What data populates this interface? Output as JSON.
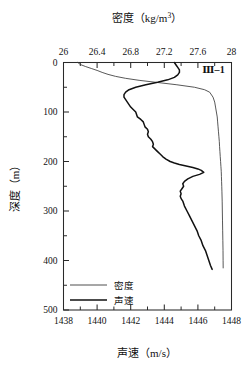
{
  "panel": {
    "label": "Ⅲ–1"
  },
  "axes": {
    "top": {
      "title": "密度（kg/m³）",
      "title_main": "密度",
      "title_unit": "（kg/m",
      "title_sup": "3",
      "title_close": "）",
      "ticks": [
        "26",
        "26.4",
        "26.8",
        "27.2",
        "27.6",
        "28"
      ],
      "tick_values": [
        26,
        26.4,
        26.8,
        27.2,
        27.6,
        28
      ],
      "range": [
        26,
        28
      ]
    },
    "bottom": {
      "title": "声速（m/s）",
      "title_main": "声速",
      "title_unit": "（m/s）",
      "ticks": [
        "1438",
        "1440",
        "1442",
        "1444",
        "1446",
        "1448"
      ],
      "tick_values": [
        1438,
        1440,
        1442,
        1444,
        1446,
        1448
      ],
      "range": [
        1438,
        1448
      ]
    },
    "left": {
      "title": "深度（m）",
      "title_main": "深度",
      "title_unit": "（m）",
      "ticks": [
        "0",
        "100",
        "200",
        "300",
        "400",
        "500"
      ],
      "tick_values": [
        0,
        100,
        200,
        300,
        400,
        500
      ],
      "range": [
        0,
        500
      ]
    }
  },
  "legend": {
    "items": [
      {
        "label": "密度",
        "style": "thin"
      },
      {
        "label": "声速",
        "style": "thick"
      }
    ]
  },
  "colors": {
    "axis": "#2a2a2a",
    "density_line": "#3a3a3a",
    "speed_line": "#111111",
    "background": "#ffffff"
  },
  "chart_data": {
    "type": "line",
    "subtitle": "Ⅲ–1",
    "orientation": "vertical-profile",
    "xlabel_top": "密度（kg/m³）",
    "xlabel_bottom": "声速（m/s）",
    "ylabel": "深度（m）",
    "ylim": [
      0,
      500
    ],
    "y_inverted": true,
    "xlim_top": [
      26,
      28
    ],
    "xlim_bottom": [
      1438,
      1448
    ],
    "grid": false,
    "legend_position": "bottom-left",
    "series": [
      {
        "name": "密度",
        "axis": "top",
        "units": "kg/m³",
        "depth": [
          0,
          4,
          8,
          12,
          16,
          20,
          24,
          28,
          32,
          36,
          40,
          45,
          50,
          55,
          60,
          70,
          80,
          90,
          100,
          110,
          120,
          130,
          140,
          150,
          160,
          170,
          180,
          190,
          200,
          205,
          210,
          215,
          220,
          230,
          240,
          250,
          260,
          280,
          300,
          320,
          340,
          360,
          380,
          400,
          415
        ],
        "values": [
          26.17,
          26.2,
          26.26,
          26.33,
          26.4,
          26.46,
          26.53,
          26.62,
          26.74,
          26.9,
          27.1,
          27.35,
          27.56,
          27.68,
          27.74,
          27.78,
          27.8,
          27.81,
          27.82,
          27.83,
          27.835,
          27.84,
          27.845,
          27.85,
          27.855,
          27.858,
          27.862,
          27.866,
          27.87,
          27.872,
          27.874,
          27.876,
          27.878,
          27.88,
          27.882,
          27.884,
          27.886,
          27.889,
          27.891,
          27.893,
          27.895,
          27.897,
          27.899,
          27.9,
          27.901
        ]
      },
      {
        "name": "声速",
        "axis": "bottom",
        "units": "m/s",
        "depth": [
          0,
          5,
          10,
          15,
          20,
          25,
          30,
          35,
          40,
          45,
          50,
          55,
          60,
          65,
          70,
          75,
          80,
          85,
          90,
          95,
          100,
          105,
          110,
          115,
          120,
          125,
          130,
          135,
          140,
          145,
          150,
          155,
          160,
          165,
          170,
          175,
          180,
          185,
          190,
          195,
          200,
          203,
          206,
          209,
          212,
          215,
          218,
          222,
          226,
          230,
          235,
          240,
          245,
          250,
          255,
          260,
          265,
          270,
          275,
          280,
          290,
          300,
          310,
          320,
          330,
          340,
          350,
          360,
          370,
          380,
          390,
          400,
          410,
          418
        ],
        "values": [
          1444.6,
          1444.7,
          1444.8,
          1444.9,
          1444.9,
          1444.8,
          1444.6,
          1444.2,
          1443.6,
          1442.9,
          1442.3,
          1441.9,
          1441.7,
          1441.6,
          1441.6,
          1441.7,
          1441.8,
          1441.9,
          1442.0,
          1442.15,
          1442.3,
          1442.35,
          1442.4,
          1442.6,
          1442.75,
          1442.8,
          1442.85,
          1443.0,
          1443.05,
          1443.0,
          1443.05,
          1443.2,
          1443.3,
          1443.35,
          1443.3,
          1443.45,
          1443.6,
          1443.75,
          1443.9,
          1444.1,
          1444.35,
          1444.6,
          1444.9,
          1445.3,
          1445.7,
          1446.0,
          1446.2,
          1446.35,
          1446.1,
          1445.7,
          1445.4,
          1445.2,
          1445.1,
          1445.15,
          1445.05,
          1444.95,
          1445.0,
          1444.95,
          1445.0,
          1445.1,
          1445.2,
          1445.35,
          1445.5,
          1445.65,
          1445.8,
          1445.95,
          1446.05,
          1446.2,
          1446.3,
          1446.45,
          1446.55,
          1446.65,
          1446.75,
          1446.85
        ]
      }
    ]
  }
}
